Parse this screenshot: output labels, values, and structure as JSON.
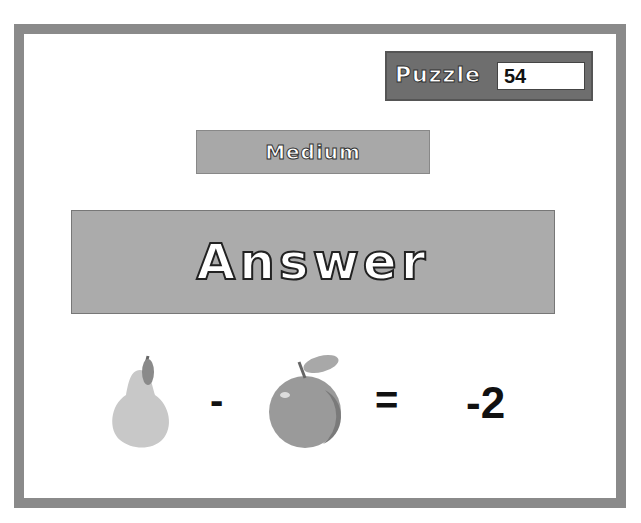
{
  "puzzle": {
    "label": "Puzzle",
    "number": "54"
  },
  "difficulty": {
    "label": "Medium"
  },
  "answer_button": {
    "label": "Answer"
  },
  "equation": {
    "operand1": "pear-icon",
    "operator": "-",
    "operand2": "apple-icon",
    "equals": "=",
    "result": "-2"
  },
  "colors": {
    "frame": "#8a8a8a",
    "panel": "#ababab",
    "puzzle_box": "#6e6e6e"
  }
}
